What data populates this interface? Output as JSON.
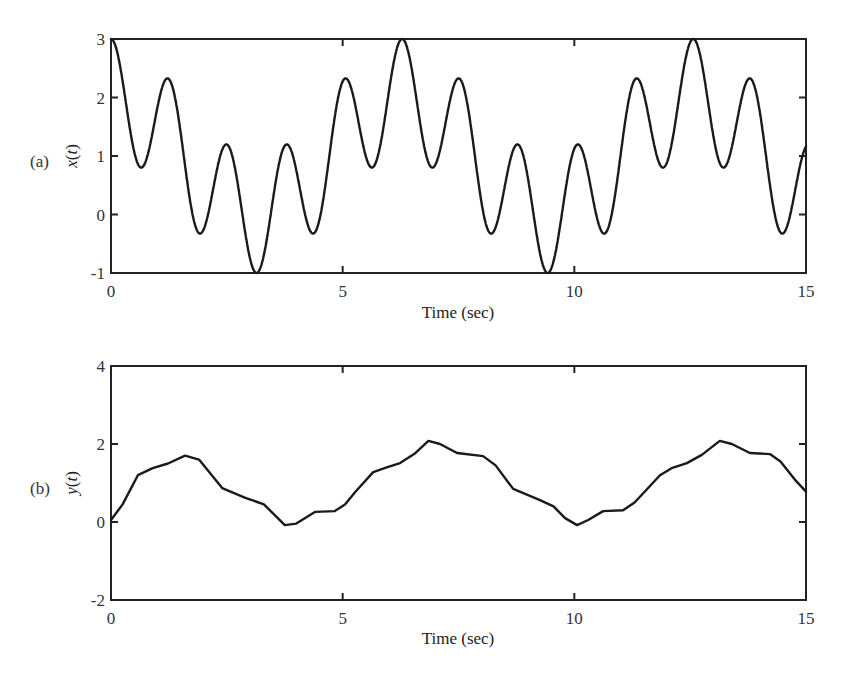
{
  "figure": {
    "panels": [
      {
        "id": "a",
        "panel_label": "(a)",
        "ylabel_func": "x",
        "ylabel_var": "t",
        "xlabel": "Time (sec)",
        "xticks": [
          "0",
          "5",
          "10",
          "15"
        ],
        "yticks": [
          "3",
          "2",
          "1",
          "0",
          "-1"
        ]
      },
      {
        "id": "b",
        "panel_label": "(b)",
        "ylabel_func": "y",
        "ylabel_var": "t",
        "xlabel": "Time (sec)",
        "xticks": [
          "0",
          "5",
          "10",
          "15"
        ],
        "yticks": [
          "4",
          "2",
          "0",
          "-2"
        ]
      }
    ]
  },
  "chart_data": [
    {
      "type": "line",
      "panel": "(a)",
      "title": "",
      "xlabel": "Time (sec)",
      "ylabel": "x(t)",
      "xlim": [
        0,
        15
      ],
      "ylim": [
        -1,
        3
      ],
      "xticks": [
        0,
        5,
        10,
        15
      ],
      "yticks": [
        -1,
        0,
        1,
        2,
        3
      ],
      "grid": false,
      "legend": null,
      "formula": "x(t) = 1 + cos(t) + cos(5t)",
      "series": [
        {
          "name": "x(t)",
          "x": [
            0,
            0.63,
            1.26,
            1.89,
            2.51,
            3.14,
            3.77,
            4.4,
            5.03,
            5.65,
            6.28,
            6.91,
            7.54,
            8.17,
            8.8,
            9.42,
            10.05,
            10.68,
            11.31,
            11.94,
            12.57,
            13.19,
            13.82,
            14.45,
            15.0
          ],
          "y": [
            3.0,
            0.81,
            2.31,
            -0.31,
            1.19,
            -1.0,
            1.19,
            -0.31,
            2.31,
            0.81,
            3.0,
            0.81,
            2.31,
            -0.31,
            1.19,
            -1.0,
            1.19,
            -0.31,
            2.31,
            0.81,
            3.0,
            0.81,
            2.31,
            -0.31,
            1.17
          ]
        }
      ]
    },
    {
      "type": "line",
      "panel": "(b)",
      "title": "",
      "xlabel": "Time (sec)",
      "ylabel": "y(t)",
      "xlim": [
        0,
        15
      ],
      "ylim": [
        -2,
        4
      ],
      "xticks": [
        0,
        5,
        10,
        15
      ],
      "yticks": [
        -2,
        0,
        2,
        4
      ],
      "grid": false,
      "legend": null,
      "series": [
        {
          "name": "y(t)",
          "x": [
            0,
            0.25,
            0.58,
            0.9,
            1.23,
            1.6,
            1.9,
            2.4,
            2.9,
            3.3,
            3.6,
            3.75,
            4.0,
            4.4,
            4.83,
            5.05,
            5.27,
            5.66,
            5.95,
            6.24,
            6.55,
            6.85,
            7.1,
            7.47,
            8.03,
            8.3,
            8.68,
            9.26,
            9.55,
            9.8,
            10.06,
            10.3,
            10.62,
            11.05,
            11.3,
            11.85,
            12.1,
            12.43,
            12.75,
            13.14,
            13.4,
            13.79,
            14.22,
            14.45,
            14.75,
            15.0
          ],
          "y": [
            0.05,
            0.45,
            1.2,
            1.38,
            1.5,
            1.7,
            1.6,
            0.87,
            0.62,
            0.45,
            0.1,
            -0.08,
            -0.04,
            0.26,
            0.28,
            0.45,
            0.77,
            1.28,
            1.4,
            1.51,
            1.75,
            2.08,
            2.0,
            1.77,
            1.69,
            1.45,
            0.85,
            0.56,
            0.4,
            0.1,
            -0.08,
            0.05,
            0.28,
            0.3,
            0.5,
            1.2,
            1.38,
            1.51,
            1.72,
            2.08,
            2.0,
            1.77,
            1.74,
            1.55,
            1.1,
            0.78
          ]
        }
      ]
    }
  ]
}
